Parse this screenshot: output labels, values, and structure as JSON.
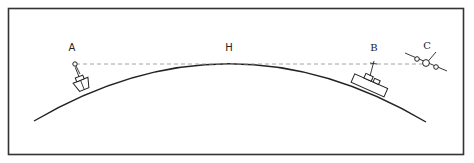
{
  "diagram": {
    "type": "line-of-sight over earth curvature",
    "labels": {
      "a": "A",
      "h": "H",
      "b": "B",
      "c": "C"
    },
    "elements": [
      {
        "id": "A",
        "description": "ship with mast-top observer on curved horizon (left)"
      },
      {
        "id": "H",
        "description": "horizon point, top of earth curve, tangent to line of sight"
      },
      {
        "id": "B",
        "description": "larger ship with mast on right side of curve"
      },
      {
        "id": "C",
        "description": "aircraft in flight beyond B along line of sight"
      }
    ],
    "line_of_sight": {
      "style": "dashed",
      "color": "#999999"
    },
    "colors": {
      "stroke": "#222222",
      "frame": "#333333",
      "dash": "#9a9a9a",
      "background": "#ffffff"
    }
  }
}
